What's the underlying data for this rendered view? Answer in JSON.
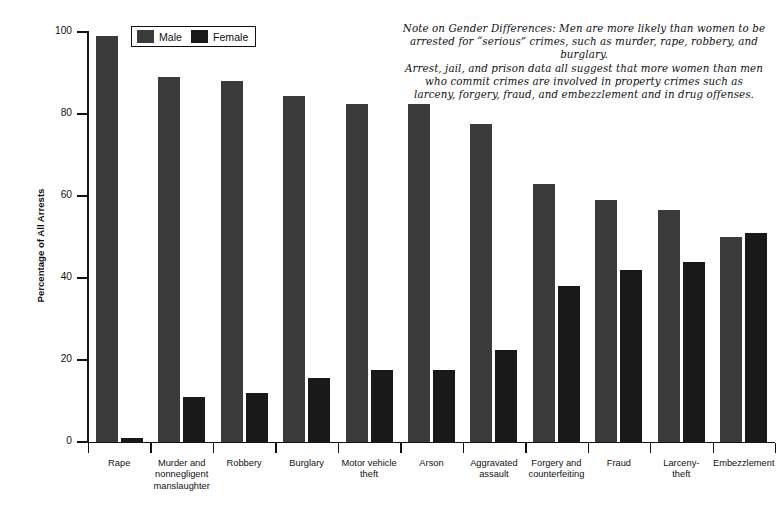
{
  "chart_data": {
    "type": "bar",
    "title": "",
    "xlabel": "",
    "ylabel": "Percentage of All Arrests",
    "ylim": [
      0,
      100
    ],
    "yticks": [
      0,
      20,
      40,
      60,
      80,
      100
    ],
    "grid": false,
    "legend_position": "top-left-inside",
    "categories": [
      "Rape",
      "Murder and nonnegligent manslaughter",
      "Robbery",
      "Burglary",
      "Motor vehicle theft",
      "Arson",
      "Aggravated assault",
      "Forgery and counterfeiting",
      "Fraud",
      "Larceny-theft",
      "Embezzlement"
    ],
    "category_lines": [
      [
        "Rape"
      ],
      [
        "Murder and",
        "nonnegligent",
        "manslaughter"
      ],
      [
        "Robbery"
      ],
      [
        "Burglary"
      ],
      [
        "Motor vehicle",
        "theft"
      ],
      [
        "Arson"
      ],
      [
        "Aggravated",
        "assault"
      ],
      [
        "Forgery and",
        "counterfeiting"
      ],
      [
        "Fraud"
      ],
      [
        "Larceny-",
        "theft"
      ],
      [
        "Embezzlement"
      ]
    ],
    "series": [
      {
        "name": "Male",
        "color": "#3b3b3b",
        "values": [
          99,
          89,
          88,
          84.5,
          82.5,
          82.5,
          77.5,
          63,
          59,
          56.5,
          50
        ]
      },
      {
        "name": "Female",
        "color": "#191919",
        "values": [
          1,
          11,
          12,
          15.5,
          17.5,
          17.5,
          22.5,
          38,
          42,
          44,
          51
        ]
      }
    ]
  },
  "legend": {
    "items": [
      {
        "label": "Male",
        "color": "#3b3b3b"
      },
      {
        "label": "Female",
        "color": "#191919"
      }
    ]
  },
  "note": {
    "lines": [
      "Note on Gender Differences: Men are more likely than women to be",
      "arrested for “serious” crimes, such as murder, rape, robbery, and burglary.",
      "Arrest, jail, and prison data all suggest that more women than men",
      "who commit crimes are involved in property crimes such as",
      "larceny, forgery, fraud, and embezzlement and in drug offenses."
    ]
  }
}
